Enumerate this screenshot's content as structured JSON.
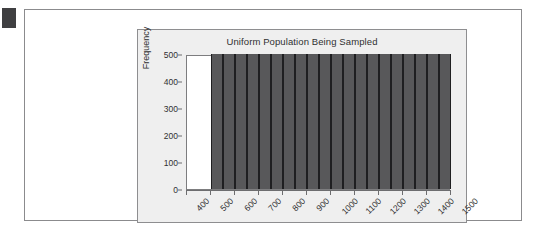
{
  "page": {
    "background_color": "#ffffff",
    "corner_marker_color": "#3f3f41"
  },
  "chart_panel": {
    "background_color": "#efefef",
    "border_color": "#8e8e90"
  },
  "chart_data": {
    "type": "bar",
    "title": "Uniform Population Being Sampled",
    "xlabel": "",
    "ylabel": "Frequency",
    "ylim": [
      0,
      500
    ],
    "xlim": [
      400,
      1500
    ],
    "grid": false,
    "legend": null,
    "bar_color": "#58585a",
    "bar_edge_color": "#1f1f21",
    "ytick_labels": [
      "0",
      "100",
      "200",
      "300",
      "400",
      "500"
    ],
    "ytick_values": [
      0,
      100,
      200,
      300,
      400,
      500
    ],
    "xtick_labels": [
      "400",
      "500",
      "600",
      "700",
      "800",
      "900",
      "1000",
      "1100",
      "1200",
      "1300",
      "1400",
      "1500"
    ],
    "xtick_values": [
      400,
      500,
      600,
      700,
      800,
      900,
      1000,
      1100,
      1200,
      1300,
      1400,
      1500
    ],
    "bin_edges": [
      500,
      550,
      600,
      650,
      700,
      750,
      800,
      850,
      900,
      950,
      1000,
      1050,
      1100,
      1150,
      1200,
      1250,
      1300,
      1350,
      1400,
      1450,
      1500
    ],
    "categories": [
      "500-550",
      "550-600",
      "600-650",
      "650-700",
      "700-750",
      "750-800",
      "800-850",
      "850-900",
      "900-950",
      "950-1000",
      "1000-1050",
      "1050-1100",
      "1100-1150",
      "1150-1200",
      "1200-1250",
      "1250-1300",
      "1300-1350",
      "1350-1400",
      "1400-1450",
      "1450-1500"
    ],
    "values": [
      500,
      500,
      500,
      500,
      500,
      500,
      500,
      500,
      500,
      500,
      500,
      500,
      500,
      500,
      500,
      500,
      500,
      500,
      500,
      500
    ]
  }
}
